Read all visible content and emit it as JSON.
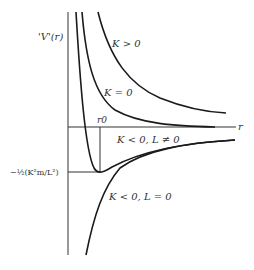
{
  "diagram": {
    "y_axis_label": "'V'(r)",
    "x_axis_label": "r",
    "r0_label": "r0",
    "min_level_label": "−½(K²m/L²)",
    "curves": [
      {
        "id": "k-positive",
        "label": "K > 0"
      },
      {
        "id": "k-zero",
        "label": "K = 0"
      },
      {
        "id": "k-negative-l-nonzero",
        "label": "K < 0, L ≠ 0"
      },
      {
        "id": "k-negative-l-zero",
        "label": "K < 0, L = 0"
      }
    ],
    "colors": {
      "ink": "#1a1a1a",
      "axis": "#333333",
      "background": "#ffffff"
    }
  }
}
